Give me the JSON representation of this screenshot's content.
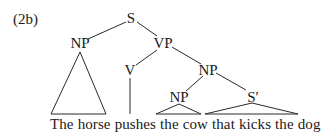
{
  "example_label": "(2b)",
  "tree": {
    "nodes": [
      {
        "id": "S",
        "label": "S",
        "x": 131,
        "y": 11
      },
      {
        "id": "NP1",
        "label": "NP",
        "x": 80,
        "y": 36
      },
      {
        "id": "VP",
        "label": "VP",
        "x": 163,
        "y": 36
      },
      {
        "id": "V",
        "label": "V",
        "x": 130,
        "y": 63
      },
      {
        "id": "NP2",
        "label": "NP",
        "x": 208,
        "y": 63
      },
      {
        "id": "NP3",
        "label": "NP",
        "x": 179,
        "y": 90
      },
      {
        "id": "Sbar",
        "label": "S′",
        "x": 253,
        "y": 90
      }
    ],
    "edges": [
      [
        "S",
        "NP1"
      ],
      [
        "S",
        "VP"
      ],
      [
        "VP",
        "V"
      ],
      [
        "VP",
        "NP2"
      ],
      [
        "NP2",
        "NP3"
      ],
      [
        "NP2",
        "Sbar"
      ]
    ],
    "triangles": [
      {
        "node": "NP1",
        "covers": "The horse"
      },
      {
        "node": "NP3",
        "covers": "the cow"
      },
      {
        "node": "Sbar",
        "covers": "that kicks the dog"
      }
    ]
  },
  "sentence": {
    "words": [
      "The",
      "horse",
      "pushes",
      "the",
      "cow",
      "that",
      "kicks",
      "the",
      "dog"
    ]
  }
}
